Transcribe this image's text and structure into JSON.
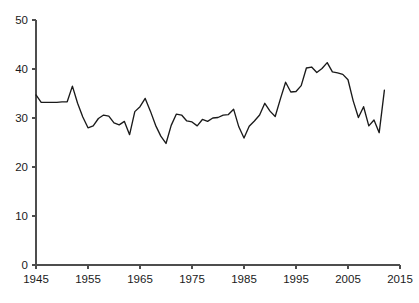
{
  "chart_data": {
    "type": "line",
    "title": "",
    "subtitle": "",
    "xlabel": "",
    "ylabel": "",
    "xlim": [
      1945,
      2015
    ],
    "ylim": [
      0,
      50
    ],
    "grid": false,
    "legend": null,
    "legend_position": "none",
    "xticks": [
      1945,
      1955,
      1965,
      1975,
      1985,
      1995,
      2005,
      2015
    ],
    "xtick_labels": [
      "1945",
      "1955",
      "1965",
      "1975",
      "1985",
      "1995",
      "2005",
      "2015"
    ],
    "yticks": [
      0,
      10,
      20,
      30,
      40,
      50
    ],
    "ytick_labels": [
      "0",
      "10",
      "20",
      "30",
      "40",
      "50"
    ],
    "line_color": "#1a1a1a",
    "axis_color": "#4d4d4d",
    "background_color": "#ffffff",
    "series": [
      {
        "name": "series-1",
        "x": [
          1945,
          1946,
          1947,
          1948,
          1949,
          1950,
          1951,
          1952,
          1953,
          1954,
          1955,
          1956,
          1957,
          1958,
          1959,
          1960,
          1961,
          1962,
          1963,
          1964,
          1965,
          1966,
          1967,
          1968,
          1969,
          1970,
          1971,
          1972,
          1973,
          1974,
          1975,
          1976,
          1977,
          1978,
          1979,
          1980,
          1981,
          1982,
          1983,
          1984,
          1985,
          1986,
          1987,
          1988,
          1989,
          1990,
          1991,
          1992,
          1993,
          1994,
          1995,
          1996,
          1997,
          1998,
          1999,
          2000,
          2001,
          2002,
          2003,
          2004,
          2005,
          2006,
          2007,
          2008,
          2009,
          2010,
          2011,
          2012
        ],
        "y": [
          34.7,
          33.2,
          33.2,
          33.2,
          33.2,
          33.3,
          33.3,
          36.5,
          33.0,
          30.2,
          28.0,
          28.4,
          29.9,
          30.6,
          30.4,
          29.0,
          28.6,
          29.3,
          26.6,
          31.3,
          32.3,
          34.0,
          31.4,
          28.5,
          26.3,
          24.8,
          28.5,
          30.8,
          30.6,
          29.4,
          29.2,
          28.4,
          29.7,
          29.3,
          30.0,
          30.1,
          30.6,
          30.7,
          31.8,
          28.2,
          25.9,
          28.3,
          29.4,
          30.6,
          33.0,
          31.4,
          30.3,
          33.9,
          37.3,
          35.3,
          35.4,
          36.6,
          40.2,
          40.4,
          39.3,
          40.1,
          41.3,
          39.4,
          39.2,
          38.9,
          37.8,
          33.5,
          30.1,
          32.3,
          28.4,
          29.6,
          27.0,
          35.7
        ]
      }
    ],
    "data_point_count": 68
  },
  "plot": {
    "x_axis_name": "x-axis",
    "y_axis_name": "y-axis",
    "series_name": "data-line"
  }
}
